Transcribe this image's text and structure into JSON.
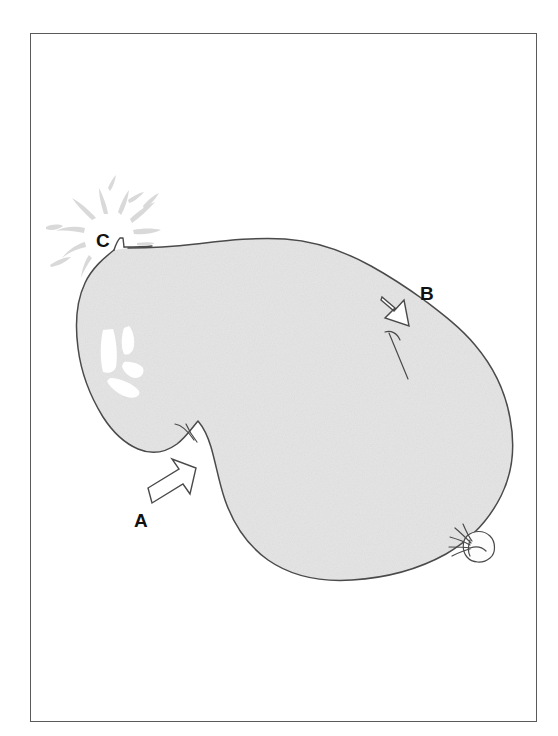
{
  "figure": {
    "kind": "line-art-diagram",
    "frame": {
      "border_color": "#5a5a5a",
      "background_color": "#ffffff",
      "x": 30,
      "y": 33,
      "width": 507,
      "height": 689
    },
    "balloon": {
      "fill_color": "#e4e4e4",
      "outline_color": "#4a4a4a",
      "highlight_color": "#ffffff",
      "splash_color": "#d8d8d8"
    },
    "labels": [
      {
        "id": "A",
        "text": "A",
        "x": 134,
        "y": 511,
        "marker": "outline-arrow",
        "arrow_direction": "up-right",
        "points_at": "concave indentation on lower-left wall"
      },
      {
        "id": "B",
        "text": "B",
        "x": 420,
        "y": 284,
        "marker": "outline-arrow",
        "arrow_direction": "down-left",
        "points_at": "crease / fold line on upper-right wall"
      },
      {
        "id": "C",
        "text": "C",
        "x": 96,
        "y": 231,
        "marker": "burst-splash",
        "arrow_direction": "none",
        "points_at": "leak / rupture point at upper-left tip"
      }
    ],
    "details": [
      {
        "name": "tied-knot",
        "description": "tied-off balloon neck and knot",
        "x": 470,
        "y": 540
      },
      {
        "name": "shine-highlight",
        "description": "white glare patches on left side",
        "x": 115,
        "y": 350
      },
      {
        "name": "crease-line-b",
        "description": "short fold line near label B",
        "x": 395,
        "y": 355
      },
      {
        "name": "crease-line-a",
        "description": "short fold line near label A",
        "x": 185,
        "y": 432
      }
    ]
  }
}
